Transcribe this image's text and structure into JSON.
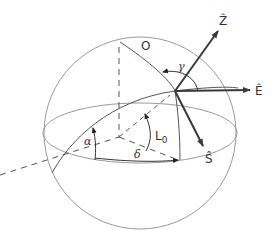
{
  "diagram": {
    "type": "celestial-sphere",
    "labels": {
      "zenith": "Ẑ",
      "east": "Ê",
      "south": "Ŝ",
      "origin": "O",
      "gamma": "γ",
      "alpha": "α",
      "delta": "δ",
      "latitude": "L",
      "latitude_sub": "0"
    },
    "colors": {
      "sphere_line": "#9a9a9a",
      "great_circle": "#555555",
      "vector": "#3a3a3a",
      "dashed": "#555555"
    }
  }
}
